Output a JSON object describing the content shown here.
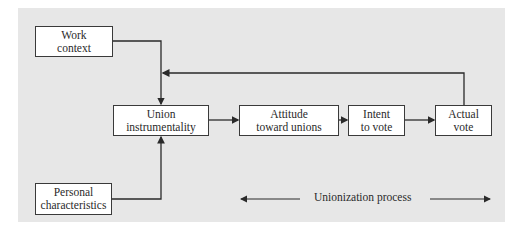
{
  "diagram": {
    "nodes": {
      "work_context": {
        "line1": "Work",
        "line2": "context"
      },
      "personal_characteristics": {
        "line1": "Personal",
        "line2": "characteristics"
      },
      "union_instrumentality": {
        "line1": "Union",
        "line2": "instrumentality"
      },
      "attitude": {
        "line1": "Attitude",
        "line2": "toward unions"
      },
      "intent": {
        "line1": "Intent",
        "line2": "to vote"
      },
      "actual_vote": {
        "line1": "Actual",
        "line2": "vote"
      }
    },
    "process_label": "Unionization process",
    "colors": {
      "background": "#e7e7e7",
      "box": "#ffffff",
      "line": "#2a2a2a"
    }
  }
}
